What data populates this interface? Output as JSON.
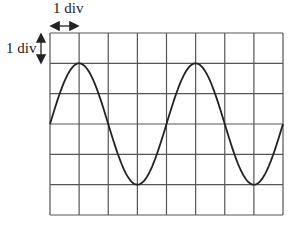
{
  "diagram": {
    "type": "oscilloscope-grid",
    "horizontal_scale_label": "1 div",
    "vertical_scale_label": "1 div",
    "grid": {
      "columns": 8,
      "rows": 6
    },
    "waveform": {
      "shape": "sine",
      "amplitude_div": 2,
      "period_div": 4,
      "cycles_shown": 2,
      "start_phase": "zero-crossing rising, at center line"
    },
    "colors": {
      "grid": "#555555",
      "wave": "#222222",
      "background": "#ffffff"
    }
  }
}
